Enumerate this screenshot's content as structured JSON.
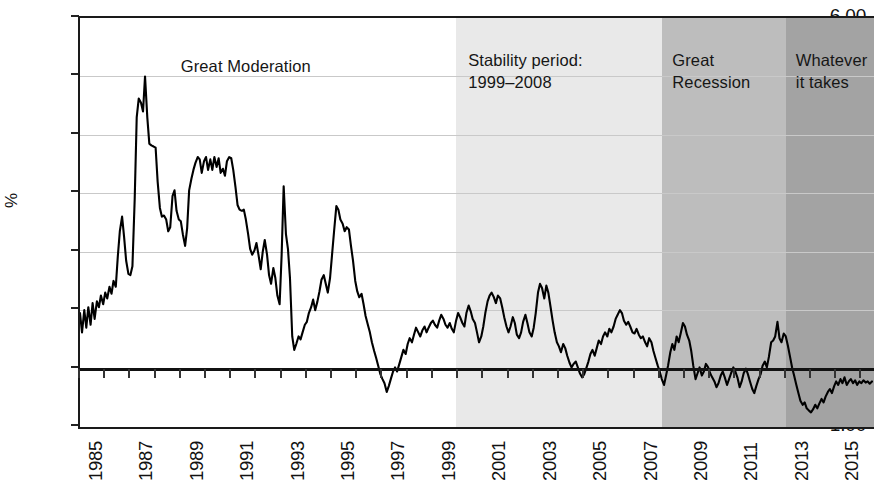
{
  "chart": {
    "type": "line",
    "ylabel": "%",
    "xlabel": "",
    "title": "",
    "grid": true,
    "legend": "none"
  },
  "yaxis": {
    "min": -1.0,
    "max": 6.0,
    "step": 1.0,
    "label": "%",
    "ticks": [
      "6.00",
      "5.00",
      "4.00",
      "3.00",
      "2.00",
      "1.00",
      "0.00",
      "-1.00"
    ],
    "tick_values": [
      6,
      5,
      4,
      3,
      2,
      1,
      0,
      -1
    ]
  },
  "xaxis": {
    "min": 1985,
    "max": 2016.5,
    "tick_years": [
      1985,
      1986,
      1987,
      1988,
      1989,
      1990,
      1991,
      1992,
      1993,
      1994,
      1995,
      1996,
      1997,
      1998,
      1999,
      2000,
      2001,
      2002,
      2003,
      2004,
      2005,
      2006,
      2007,
      2008,
      2009,
      2010,
      2011,
      2012,
      2013,
      2014,
      2015,
      2016
    ],
    "labels": [
      {
        "year": 1985,
        "text": "1985"
      },
      {
        "year": 1987,
        "text": "1987"
      },
      {
        "year": 1989,
        "text": "1989"
      },
      {
        "year": 1991,
        "text": "1991"
      },
      {
        "year": 1993,
        "text": "1993"
      },
      {
        "year": 1995,
        "text": "1995"
      },
      {
        "year": 1997,
        "text": "1997"
      },
      {
        "year": 1999,
        "text": "1999"
      },
      {
        "year": 2001,
        "text": "2001"
      },
      {
        "year": 2003,
        "text": "2003"
      },
      {
        "year": 2005,
        "text": "2005"
      },
      {
        "year": 2007,
        "text": "2007"
      },
      {
        "year": 2009,
        "text": "2009"
      },
      {
        "year": 2011,
        "text": "2011"
      },
      {
        "year": 2013,
        "text": "2013"
      },
      {
        "year": 2015,
        "text": "2015"
      }
    ]
  },
  "bands": [
    {
      "id": "stability-period",
      "from": 1999.9,
      "to": 2008.1,
      "color": "#e9e9e9"
    },
    {
      "id": "great-recession",
      "from": 2008.1,
      "to": 2013.0,
      "color": "#bdbdbd"
    },
    {
      "id": "whatever-it-takes",
      "from": 2013.0,
      "to": 2016.5,
      "color": "#a3a3a3"
    }
  ],
  "annotations": [
    {
      "id": "great-moderation",
      "text": "Great Moderation",
      "x_year": 1989.0,
      "y_px": 38
    },
    {
      "id": "stability-period",
      "text": "Stability period:\n1999–2008",
      "x_year": 2000.4,
      "y_px": 32
    },
    {
      "id": "great-recession",
      "text": "Great\nRecession",
      "x_year": 2008.5,
      "y_px": 32
    },
    {
      "id": "whatever-it-takes",
      "text": "Whatever\nit takes",
      "x_year": 2013.4,
      "y_px": 32
    }
  ],
  "chart_data": {
    "type": "line",
    "title": "",
    "xlabel": "",
    "ylabel": "%",
    "ylim": [
      -1.0,
      6.0
    ],
    "xlim": [
      1985,
      2016.5
    ],
    "grid": true,
    "legend_position": "none",
    "annotations": [
      "Great Moderation",
      "Stability period: 1999–2008",
      "Great Recession",
      "Whatever it takes"
    ],
    "shaded_regions": [
      {
        "label": "Stability period: 1999–2008",
        "start": 1999.9,
        "end": 2008.1,
        "shade": "#e9e9e9"
      },
      {
        "label": "Great Recession",
        "start": 2008.1,
        "end": 2013.0,
        "shade": "#bdbdbd"
      },
      {
        "label": "Whatever it takes",
        "start": 2013.0,
        "end": 2016.5,
        "shade": "#a3a3a3"
      }
    ],
    "series": [
      {
        "name": "rate",
        "x": [
          1985.0,
          1985.08,
          1985.17,
          1985.25,
          1985.33,
          1985.42,
          1985.5,
          1985.58,
          1985.67,
          1985.75,
          1985.83,
          1985.92,
          1986.0,
          1986.08,
          1986.17,
          1986.25,
          1986.33,
          1986.42,
          1986.5,
          1986.58,
          1986.67,
          1986.75,
          1986.83,
          1986.92,
          1987.0,
          1987.08,
          1987.17,
          1987.25,
          1987.33,
          1987.42,
          1987.5,
          1987.58,
          1987.67,
          1987.75,
          1987.83,
          1987.92,
          1988.0,
          1988.08,
          1988.17,
          1988.25,
          1988.33,
          1988.42,
          1988.5,
          1988.58,
          1988.67,
          1988.75,
          1988.83,
          1988.92,
          1989.0,
          1989.08,
          1989.17,
          1989.25,
          1989.33,
          1989.42,
          1989.5,
          1989.58,
          1989.67,
          1989.75,
          1989.83,
          1989.92,
          1990.0,
          1990.08,
          1990.17,
          1990.25,
          1990.33,
          1990.42,
          1990.5,
          1990.58,
          1990.67,
          1990.75,
          1990.83,
          1990.92,
          1991.0,
          1991.08,
          1991.17,
          1991.25,
          1991.33,
          1991.42,
          1991.5,
          1991.58,
          1991.67,
          1991.75,
          1991.83,
          1991.92,
          1992.0,
          1992.08,
          1992.17,
          1992.25,
          1992.33,
          1992.42,
          1992.5,
          1992.58,
          1992.67,
          1992.75,
          1992.83,
          1992.92,
          1993.0,
          1993.08,
          1993.17,
          1993.25,
          1993.33,
          1993.42,
          1993.5,
          1993.58,
          1993.67,
          1993.75,
          1993.83,
          1993.92,
          1994.0,
          1994.08,
          1994.17,
          1994.25,
          1994.33,
          1994.42,
          1994.5,
          1994.58,
          1994.67,
          1994.75,
          1994.83,
          1994.92,
          1995.0,
          1995.08,
          1995.17,
          1995.25,
          1995.33,
          1995.42,
          1995.5,
          1995.58,
          1995.67,
          1995.75,
          1995.83,
          1995.92,
          1996.0,
          1996.08,
          1996.17,
          1996.25,
          1996.33,
          1996.42,
          1996.5,
          1996.58,
          1996.67,
          1996.75,
          1996.83,
          1996.92,
          1997.0,
          1997.08,
          1997.17,
          1997.25,
          1997.33,
          1997.42,
          1997.5,
          1997.58,
          1997.67,
          1997.75,
          1997.83,
          1997.92,
          1998.0,
          1998.08,
          1998.17,
          1998.25,
          1998.33,
          1998.42,
          1998.5,
          1998.58,
          1998.67,
          1998.75,
          1998.83,
          1998.92,
          1999.0,
          1999.08,
          1999.17,
          1999.25,
          1999.33,
          1999.42,
          1999.5,
          1999.58,
          1999.67,
          1999.75,
          1999.83,
          1999.92,
          2000.0,
          2000.08,
          2000.17,
          2000.25,
          2000.33,
          2000.42,
          2000.5,
          2000.58,
          2000.67,
          2000.75,
          2000.83,
          2000.92,
          2001.0,
          2001.08,
          2001.17,
          2001.25,
          2001.33,
          2001.42,
          2001.5,
          2001.58,
          2001.67,
          2001.75,
          2001.83,
          2001.92,
          2002.0,
          2002.08,
          2002.17,
          2002.25,
          2002.33,
          2002.42,
          2002.5,
          2002.58,
          2002.67,
          2002.75,
          2002.83,
          2002.92,
          2003.0,
          2003.08,
          2003.17,
          2003.25,
          2003.33,
          2003.42,
          2003.5,
          2003.58,
          2003.67,
          2003.75,
          2003.83,
          2003.92,
          2004.0,
          2004.08,
          2004.17,
          2004.25,
          2004.33,
          2004.42,
          2004.5,
          2004.58,
          2004.67,
          2004.75,
          2004.83,
          2004.92,
          2005.0,
          2005.08,
          2005.17,
          2005.25,
          2005.33,
          2005.42,
          2005.5,
          2005.58,
          2005.67,
          2005.75,
          2005.83,
          2005.92,
          2006.0,
          2006.08,
          2006.17,
          2006.25,
          2006.33,
          2006.42,
          2006.5,
          2006.58,
          2006.67,
          2006.75,
          2006.83,
          2006.92,
          2007.0,
          2007.08,
          2007.17,
          2007.25,
          2007.33,
          2007.42,
          2007.5,
          2007.58,
          2007.67,
          2007.75,
          2007.83,
          2007.92,
          2008.0,
          2008.08,
          2008.17,
          2008.25,
          2008.33,
          2008.42,
          2008.5,
          2008.58,
          2008.67,
          2008.75,
          2008.83,
          2008.92,
          2009.0,
          2009.08,
          2009.17,
          2009.25,
          2009.33,
          2009.42,
          2009.5,
          2009.58,
          2009.67,
          2009.75,
          2009.83,
          2009.92,
          2010.0,
          2010.08,
          2010.17,
          2010.25,
          2010.33,
          2010.42,
          2010.5,
          2010.58,
          2010.67,
          2010.75,
          2010.83,
          2010.92,
          2011.0,
          2011.08,
          2011.17,
          2011.25,
          2011.33,
          2011.42,
          2011.5,
          2011.58,
          2011.67,
          2011.75,
          2011.83,
          2011.92,
          2012.0,
          2012.08,
          2012.17,
          2012.25,
          2012.33,
          2012.42,
          2012.5,
          2012.58,
          2012.67,
          2012.75,
          2012.83,
          2012.92,
          2013.0,
          2013.08,
          2013.17,
          2013.25,
          2013.33,
          2013.42,
          2013.5,
          2013.58,
          2013.67,
          2013.75,
          2013.83,
          2013.92,
          2014.0,
          2014.08,
          2014.17,
          2014.25,
          2014.33,
          2014.42,
          2014.5,
          2014.58,
          2014.67,
          2014.75,
          2014.83,
          2014.92,
          2015.0,
          2015.08,
          2015.17,
          2015.25,
          2015.33,
          2015.42,
          2015.5,
          2015.58,
          2015.67,
          2015.75,
          2015.83,
          2015.92,
          2016.0,
          2016.08,
          2016.17,
          2016.25,
          2016.33,
          2016.42
        ],
        "y": [
          0.95,
          0.62,
          1.0,
          0.7,
          1.05,
          0.75,
          1.12,
          0.85,
          1.15,
          1.05,
          1.25,
          1.1,
          1.3,
          1.2,
          1.4,
          1.28,
          1.5,
          1.4,
          1.92,
          2.35,
          2.6,
          2.25,
          1.85,
          1.62,
          1.6,
          1.75,
          2.9,
          4.3,
          4.62,
          4.55,
          4.4,
          5.0,
          4.3,
          3.85,
          3.82,
          3.8,
          3.78,
          3.2,
          2.75,
          2.6,
          2.62,
          2.55,
          2.35,
          2.42,
          2.95,
          3.05,
          2.7,
          2.55,
          2.52,
          2.3,
          2.1,
          2.4,
          3.05,
          3.25,
          3.4,
          3.52,
          3.62,
          3.58,
          3.35,
          3.55,
          3.62,
          3.4,
          3.58,
          3.4,
          3.62,
          3.45,
          3.6,
          3.35,
          3.42,
          3.3,
          3.55,
          3.62,
          3.6,
          3.4,
          3.1,
          2.8,
          2.72,
          2.7,
          2.72,
          2.55,
          2.3,
          2.05,
          1.95,
          2.02,
          2.15,
          1.95,
          1.7,
          2.0,
          2.2,
          1.95,
          1.6,
          1.45,
          1.72,
          1.55,
          1.25,
          1.1,
          1.95,
          3.12,
          2.3,
          2.05,
          1.55,
          0.55,
          0.32,
          0.42,
          0.55,
          0.5,
          0.62,
          0.75,
          0.8,
          0.95,
          1.05,
          1.18,
          1.0,
          1.15,
          1.32,
          1.52,
          1.6,
          1.45,
          1.3,
          1.55,
          1.95,
          2.35,
          2.78,
          2.72,
          2.55,
          2.48,
          2.35,
          2.42,
          2.38,
          2.1,
          1.85,
          1.5,
          1.32,
          1.22,
          1.28,
          1.1,
          0.9,
          0.75,
          0.62,
          0.45,
          0.3,
          0.18,
          0.05,
          -0.1,
          -0.18,
          -0.25,
          -0.4,
          -0.3,
          -0.18,
          -0.05,
          0.02,
          -0.05,
          0.08,
          0.2,
          0.32,
          0.25,
          0.42,
          0.52,
          0.45,
          0.58,
          0.7,
          0.62,
          0.55,
          0.65,
          0.72,
          0.62,
          0.7,
          0.78,
          0.82,
          0.75,
          0.7,
          0.82,
          0.92,
          0.85,
          0.75,
          0.7,
          0.78,
          0.68,
          0.62,
          0.82,
          0.95,
          0.88,
          0.78,
          0.72,
          0.95,
          1.08,
          0.98,
          0.85,
          0.78,
          0.62,
          0.45,
          0.55,
          0.72,
          0.95,
          1.15,
          1.25,
          1.3,
          1.22,
          1.12,
          1.25,
          1.2,
          1.05,
          0.88,
          0.72,
          0.62,
          0.72,
          0.88,
          0.78,
          0.58,
          0.52,
          0.62,
          0.8,
          0.92,
          0.78,
          0.62,
          0.55,
          0.7,
          0.95,
          1.3,
          1.45,
          1.38,
          1.2,
          1.42,
          1.3,
          1.05,
          0.82,
          0.62,
          0.45,
          0.38,
          0.28,
          0.42,
          0.35,
          0.22,
          0.1,
          0.02,
          0.08,
          0.12,
          0.02,
          -0.08,
          -0.15,
          -0.1,
          0.0,
          0.12,
          0.25,
          0.32,
          0.22,
          0.35,
          0.48,
          0.42,
          0.55,
          0.62,
          0.55,
          0.68,
          0.62,
          0.72,
          0.85,
          0.92,
          1.0,
          0.95,
          0.82,
          0.75,
          0.8,
          0.72,
          0.62,
          0.6,
          0.68,
          0.58,
          0.52,
          0.55,
          0.45,
          0.38,
          0.52,
          0.45,
          0.3,
          0.18,
          0.05,
          -0.05,
          -0.18,
          -0.28,
          -0.12,
          0.05,
          0.28,
          0.42,
          0.32,
          0.55,
          0.45,
          0.6,
          0.78,
          0.72,
          0.58,
          0.48,
          0.3,
          0.05,
          -0.18,
          -0.08,
          0.02,
          -0.12,
          -0.05,
          0.08,
          0.02,
          -0.08,
          -0.15,
          -0.22,
          -0.32,
          -0.25,
          -0.12,
          -0.05,
          -0.15,
          -0.28,
          -0.18,
          -0.08,
          0.02,
          -0.05,
          -0.15,
          -0.32,
          -0.22,
          -0.08,
          0.0,
          -0.1,
          -0.22,
          -0.35,
          -0.42,
          -0.3,
          -0.18,
          -0.1,
          0.05,
          0.12,
          0.02,
          0.2,
          0.45,
          0.48,
          0.55,
          0.8,
          0.52,
          0.45,
          0.6,
          0.55,
          0.4,
          0.2,
          0.02,
          -0.12,
          -0.28,
          -0.42,
          -0.55,
          -0.62,
          -0.58,
          -0.68,
          -0.72,
          -0.75,
          -0.7,
          -0.62,
          -0.68,
          -0.6,
          -0.52,
          -0.58,
          -0.48,
          -0.4,
          -0.35,
          -0.42,
          -0.3,
          -0.22,
          -0.28,
          -0.18,
          -0.25,
          -0.15,
          -0.28,
          -0.22,
          -0.18,
          -0.25,
          -0.2,
          -0.28,
          -0.22,
          -0.25,
          -0.2,
          -0.24,
          -0.22,
          -0.26,
          -0.22
        ]
      }
    ]
  }
}
